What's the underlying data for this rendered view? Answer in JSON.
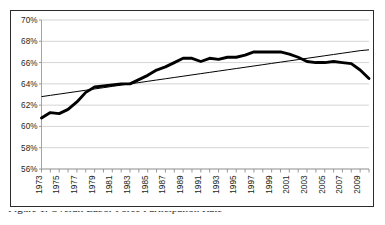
{
  "figure": {
    "caption": "Figure 1. Overall Labor Force Participation Rate",
    "caption_visible_note": "clipped at image bottom edge"
  },
  "chart_data": {
    "type": "line",
    "title": "",
    "subtitle": "",
    "xlabel": "",
    "ylabel": "",
    "grid": "horizontal",
    "legend": "none",
    "xlim": [
      1973,
      2010
    ],
    "ylim": [
      56,
      70
    ],
    "ytick_labels": [
      "70%",
      "68%",
      "66%",
      "64%",
      "62%",
      "60%",
      "58%",
      "56%"
    ],
    "ytick_values": [
      70,
      68,
      66,
      64,
      62,
      60,
      58,
      56
    ],
    "xtick_labels": [
      "1973",
      "1975",
      "1977",
      "1979",
      "1981",
      "1983",
      "1985",
      "1987",
      "1989",
      "1991",
      "1993",
      "1995",
      "1997",
      "1999",
      "2001",
      "2003",
      "2005",
      "2007",
      "2009"
    ],
    "xtick_values": [
      1973,
      1975,
      1977,
      1979,
      1981,
      1983,
      1985,
      1987,
      1989,
      1991,
      1993,
      1995,
      1997,
      1999,
      2001,
      2003,
      2005,
      2007,
      2009
    ],
    "x": [
      1973,
      1974,
      1975,
      1976,
      1977,
      1978,
      1979,
      1980,
      1981,
      1982,
      1983,
      1984,
      1985,
      1986,
      1987,
      1988,
      1989,
      1990,
      1991,
      1992,
      1993,
      1994,
      1995,
      1996,
      1997,
      1998,
      1999,
      2000,
      2001,
      2002,
      2003,
      2004,
      2005,
      2006,
      2007,
      2008,
      2009,
      2010
    ],
    "series": [
      {
        "name": "Participation rate",
        "style": "thick-solid",
        "color": "#000000",
        "values": [
          60.8,
          61.3,
          61.2,
          61.6,
          62.3,
          63.2,
          63.7,
          63.8,
          63.9,
          64.0,
          64.0,
          64.4,
          64.8,
          65.3,
          65.6,
          66.0,
          66.4,
          66.4,
          66.1,
          66.4,
          66.3,
          66.5,
          66.5,
          66.7,
          67.0,
          67.0,
          67.0,
          67.0,
          66.8,
          66.5,
          66.1,
          66.0,
          66.0,
          66.1,
          66.0,
          65.9,
          65.3,
          64.5
        ]
      },
      {
        "name": "Linear trend",
        "style": "thin-solid",
        "color": "#000000",
        "values": [
          62.8,
          62.92,
          63.04,
          63.16,
          63.28,
          63.4,
          63.52,
          63.64,
          63.76,
          63.88,
          64.0,
          64.12,
          64.24,
          64.36,
          64.48,
          64.6,
          64.72,
          64.84,
          64.96,
          65.08,
          65.2,
          65.32,
          65.44,
          65.56,
          65.68,
          65.8,
          65.92,
          66.04,
          66.16,
          66.28,
          66.4,
          66.52,
          66.64,
          66.76,
          66.88,
          67.0,
          67.12,
          67.2
        ],
        "endpoints": {
          "start": 62.8,
          "end": 67.2
        }
      }
    ]
  },
  "colors": {
    "border": "#2b2b2b",
    "gridline": "#c9c9c9",
    "axis": "#9a9a9a",
    "series": "#000000",
    "background": "#ffffff",
    "text": "#231f20"
  }
}
